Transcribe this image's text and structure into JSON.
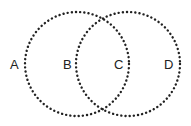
{
  "diagram": {
    "type": "venn",
    "circles": [
      {
        "name": "left-circle",
        "cx": 77,
        "cy": 64,
        "r": 52
      },
      {
        "name": "right-circle",
        "cx": 128,
        "cy": 64,
        "r": 52
      }
    ],
    "labels": [
      {
        "id": "A",
        "text": "A",
        "x": 14,
        "y": 69
      },
      {
        "id": "B",
        "text": "B",
        "x": 67,
        "y": 69
      },
      {
        "id": "C",
        "text": "C",
        "x": 119,
        "y": 69
      },
      {
        "id": "D",
        "text": "D",
        "x": 169,
        "y": 69
      }
    ],
    "stroke_color": "#222222"
  }
}
